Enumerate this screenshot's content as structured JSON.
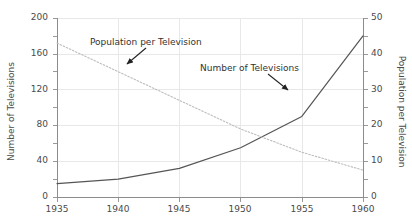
{
  "chart_data": {
    "type": "line",
    "title": "",
    "xlabel": "",
    "x": [
      1935,
      1940,
      1945,
      1950,
      1955,
      1960
    ],
    "xlim": [
      1935,
      1960
    ],
    "xticks": [
      "1935",
      "1940",
      "1945",
      "1950",
      "1955",
      "1960"
    ],
    "grid": true,
    "legend": "annotations",
    "axes": {
      "left": {
        "label": "Number of Televisions",
        "ticks": [
          "0",
          "40",
          "80",
          "120",
          "160",
          "200"
        ],
        "lim": [
          0,
          200
        ]
      },
      "right": {
        "label": "Population per Television",
        "ticks": [
          "0",
          "10",
          "20",
          "30",
          "40",
          "50"
        ],
        "lim": [
          0,
          50
        ]
      }
    },
    "series": [
      {
        "name": "Number of Televisions",
        "axis": "left",
        "style": "solid",
        "color": "#555555",
        "values": [
          15,
          20,
          32,
          55,
          90,
          180
        ]
      },
      {
        "name": "Population per Television",
        "axis": "right",
        "style": "dotted",
        "color": "#b9b9b9",
        "values": [
          43,
          35,
          27,
          19,
          12.5,
          7.5
        ]
      }
    ],
    "annotations": [
      {
        "text": "Population per Television",
        "target": "Population per Television"
      },
      {
        "text": "Number of Televisions",
        "target": "Number of Televisions"
      }
    ]
  },
  "colors": {
    "axis": "#8c8c8c",
    "grid": "#e8e8e8",
    "text": "#4a4a4a",
    "series_solid": "#555555",
    "series_dotted": "#b9b9b9"
  }
}
